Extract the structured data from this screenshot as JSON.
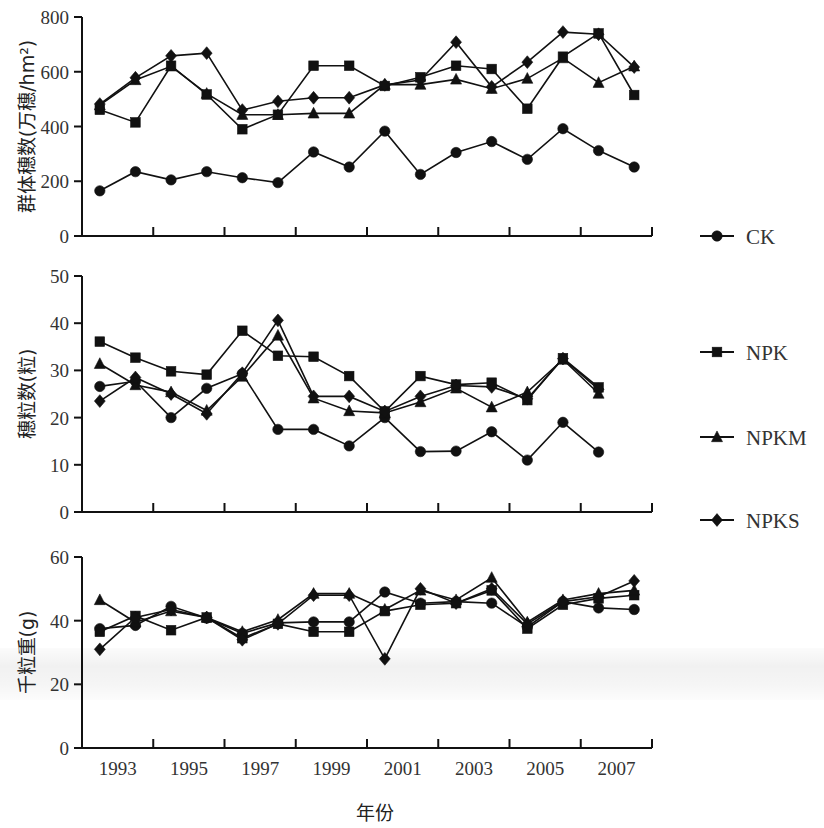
{
  "figure": {
    "xlabel": "年份",
    "x_tick_labels": [
      "1993",
      "1995",
      "1997",
      "1999",
      "2001",
      "2003",
      "2005",
      "2007"
    ],
    "legend": [
      {
        "label": "CK",
        "marker": "circle-marker"
      },
      {
        "label": "NPK",
        "marker": "square-marker"
      },
      {
        "label": "NPKM",
        "marker": "triangle-marker"
      },
      {
        "label": "NPKS",
        "marker": "diamond-marker"
      }
    ],
    "series_color": "#111111"
  },
  "chart_data": [
    {
      "type": "line",
      "panel": "top",
      "title": "",
      "ylabel": "群体穗数(万穗/hm²)",
      "xlabel": "年份",
      "ylim": [
        0,
        800
      ],
      "yticks": [
        0,
        200,
        400,
        600,
        800
      ],
      "grid": false,
      "legend_position": "right",
      "x": [
        1992,
        1993,
        1994,
        1995,
        1996,
        1997,
        1998,
        1999,
        2000,
        2001,
        2002,
        2003,
        2004,
        2005,
        2006,
        2007,
        2008
      ],
      "xtick_labels": [
        "1993",
        "1995",
        "1997",
        "1999",
        "2001",
        "2003",
        "2005",
        "2007"
      ],
      "series": [
        {
          "name": "CK",
          "values": [
            165,
            235,
            205,
            235,
            213,
            195,
            307,
            252,
            383,
            225,
            305,
            345,
            280,
            392,
            312,
            252
          ]
        },
        {
          "name": "NPK",
          "values": [
            461,
            415,
            622,
            517,
            390,
            443,
            622,
            622,
            548,
            580,
            622,
            610,
            465,
            655,
            740,
            515
          ]
        },
        {
          "name": "NPKM",
          "values": [
            478,
            570,
            620,
            520,
            443,
            443,
            448,
            448,
            553,
            553,
            572,
            538,
            575,
            650,
            560,
            620
          ]
        },
        {
          "name": "NPKS",
          "values": [
            482,
            578,
            658,
            668,
            460,
            492,
            505,
            505,
            552,
            570,
            708,
            545,
            635,
            745,
            737,
            617
          ]
        }
      ]
    },
    {
      "type": "line",
      "panel": "middle",
      "title": "",
      "ylabel": "穗粒数(粒)",
      "xlabel": "年份",
      "ylim": [
        0,
        50
      ],
      "yticks": [
        0,
        10,
        20,
        30,
        40,
        50
      ],
      "grid": false,
      "legend_position": "right",
      "x": [
        1992,
        1993,
        1994,
        1995,
        1996,
        1997,
        1998,
        1999,
        2000,
        2001,
        2002,
        2003,
        2004,
        2005,
        2006,
        2007,
        2008
      ],
      "xtick_labels": [
        "1993",
        "1995",
        "1997",
        "1999",
        "2001",
        "2003",
        "2005",
        "2007"
      ],
      "series": [
        {
          "name": "CK",
          "values": [
            26.6,
            27.7,
            20.0,
            26.2,
            29.3,
            17.5,
            17.5,
            14.0,
            20.0,
            12.8,
            12.9,
            17.0,
            11.0,
            19.0,
            12.7
          ]
        },
        {
          "name": "NPK",
          "values": [
            36.1,
            32.7,
            29.8,
            29.1,
            38.4,
            33.1,
            32.9,
            28.8,
            21.3,
            28.8,
            27.0,
            27.4,
            23.7,
            32.6,
            26.4
          ]
        },
        {
          "name": "NPKM",
          "values": [
            31.4,
            26.9,
            25.4,
            21.5,
            28.7,
            37.4,
            24.1,
            21.4,
            21.0,
            23.3,
            26.2,
            22.2,
            25.4,
            32.3,
            25.1
          ]
        },
        {
          "name": "NPKS",
          "values": [
            23.5,
            28.5,
            25.0,
            20.8,
            29.4,
            40.6,
            24.5,
            24.5,
            21.3,
            24.5,
            26.8,
            26.5,
            24.0,
            32.5,
            26.0
          ]
        }
      ]
    },
    {
      "type": "line",
      "panel": "bottom",
      "title": "",
      "ylabel": "千粒重(g)",
      "xlabel": "年份",
      "ylim": [
        0,
        60
      ],
      "yticks": [
        0,
        20,
        40,
        60
      ],
      "grid": false,
      "legend_position": "right",
      "x": [
        1992,
        1993,
        1994,
        1995,
        1996,
        1997,
        1998,
        1999,
        2000,
        2001,
        2002,
        2003,
        2004,
        2005,
        2006,
        2007,
        2008
      ],
      "xtick_labels": [
        "1993",
        "1995",
        "1997",
        "1999",
        "2001",
        "2003",
        "2005",
        "2007"
      ],
      "series": [
        {
          "name": "CK",
          "values": [
            37.5,
            38.5,
            44.5,
            40.8,
            36.0,
            39.3,
            39.6,
            39.6,
            49.0,
            45.5,
            46.0,
            45.5,
            38.0,
            46.0,
            44.0,
            43.5
          ]
        },
        {
          "name": "NPK",
          "values": [
            36.5,
            41.5,
            37.0,
            41.0,
            34.5,
            39.0,
            36.5,
            36.5,
            43.0,
            45.0,
            45.5,
            49.5,
            37.5,
            45.0,
            47.0,
            48.0
          ]
        },
        {
          "name": "NPKM",
          "values": [
            46.5,
            39.5,
            43.0,
            41.0,
            36.5,
            40.3,
            48.5,
            48.5,
            43.5,
            49.5,
            46.5,
            53.5,
            39.5,
            46.5,
            48.5,
            49.5
          ]
        },
        {
          "name": "NPKS",
          "values": [
            31.0,
            41.0,
            43.5,
            41.0,
            34.0,
            39.0,
            48.0,
            48.0,
            28.0,
            50.0,
            45.5,
            50.0,
            39.0,
            46.0,
            47.5,
            52.5
          ]
        }
      ]
    }
  ]
}
